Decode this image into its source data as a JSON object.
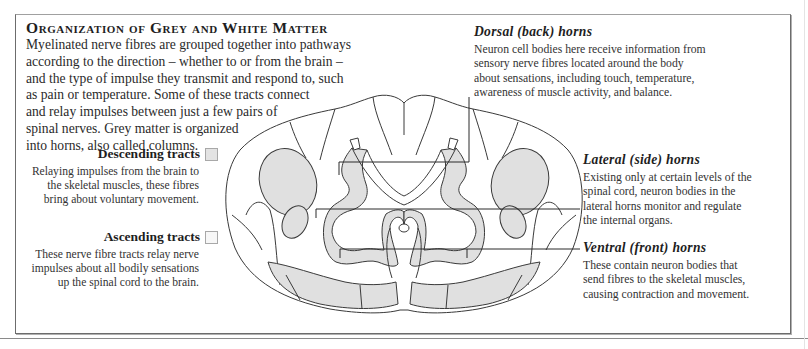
{
  "title": "Organization of Grey and White Matter",
  "intro_lines": [
    "Myelinated nerve fibres are grouped together into pathways",
    "according to the direction – whether to or from the brain –",
    "and the type of impulse they transmit and respond to, such",
    "as pain or temperature. Some of these tracts connect",
    "and relay impulses between just a few pairs of",
    "spinal nerves. Grey matter is organized",
    "into horns, also called columns."
  ],
  "legend": {
    "descending": {
      "label": "Descending tracts",
      "swatch_color": "#e3e3e3",
      "lines": [
        "Relaying impulses from the brain to",
        "the skeletal muscles, these fibres",
        "bring about voluntary movement."
      ]
    },
    "ascending": {
      "label": "Ascending tracts",
      "swatch_color": "#f7f7f7",
      "lines": [
        "These nerve fibre tracts relay nerve",
        "impulses about all bodily sensations",
        "up the spinal cord to the brain."
      ]
    }
  },
  "callouts": {
    "dorsal": {
      "label": "Dorsal (back) horns",
      "lines": [
        "Neuron cell bodies here receive information from",
        "sensory nerve fibres located around the body",
        "about sensations, including touch, temperature,",
        "awareness of muscle activity, and balance."
      ]
    },
    "lateral": {
      "label": "Lateral (side) horns",
      "lines": [
        "Existing only at certain levels of the",
        "spinal cord, neuron bodies in the",
        "lateral horns monitor and regulate",
        "the internal organs."
      ]
    },
    "ventral": {
      "label": "Ventral (front) horns",
      "lines": [
        "These contain neuron bodies that",
        "send fibres to the skeletal muscles,",
        "causing contraction and movement."
      ]
    }
  },
  "colors": {
    "grey_matter": "#e0e0e0",
    "descending_fill": "#e3e3e3",
    "outline": "#3a3a3a",
    "frame": "#6c6c6c"
  }
}
